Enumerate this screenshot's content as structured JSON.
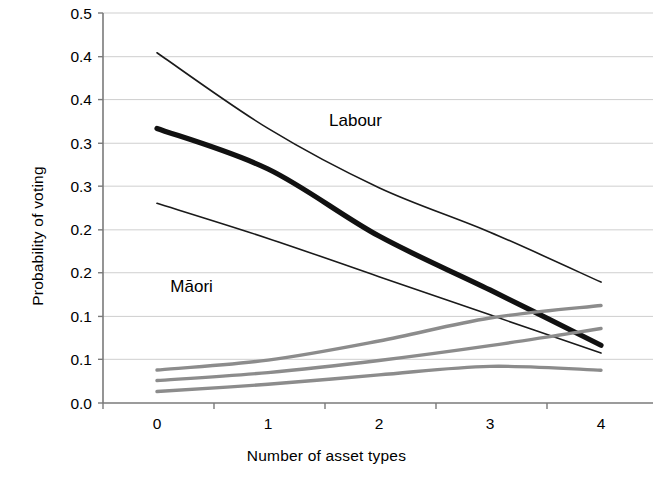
{
  "chart_data": {
    "type": "line",
    "title": "",
    "xlabel": "Number of asset types",
    "ylabel": "Probability of voting",
    "x": [
      0,
      1,
      2,
      3,
      4
    ],
    "xtick_labels": [
      "0",
      "1",
      "2",
      "3",
      "4"
    ],
    "ytick_labels": [
      "0.5",
      "0.4",
      "0.4",
      "0.3",
      "0.3",
      "0.2",
      "0.2",
      "0.1",
      "0.1",
      "0.0"
    ],
    "ytick_values": [
      0.5,
      0.444,
      0.389,
      0.333,
      0.278,
      0.222,
      0.167,
      0.111,
      0.056,
      0.0
    ],
    "ylim": [
      0.0,
      0.5
    ],
    "xlim": [
      -0.5,
      4.5
    ],
    "grid": true,
    "grid_axis": "y",
    "legend": "none",
    "annotations": [
      {
        "text": "Labour",
        "x": 1.55,
        "y": 0.355
      },
      {
        "text": "Māori",
        "x": 0.12,
        "y": 0.142
      }
    ],
    "colors": {
      "labour_main": "#111111",
      "labour_bounds": "#1a1a1a",
      "maori": "#8c8c8c",
      "gridline": "#c9c9c9",
      "axis": "#7a7a7a"
    },
    "series": [
      {
        "name": "Labour upper bound",
        "group": "Labour",
        "role": "confidence-upper",
        "color": "#1a1a1a",
        "width": 1.6,
        "values": [
          0.449,
          0.352,
          0.276,
          0.219,
          0.155
        ]
      },
      {
        "name": "Labour",
        "group": "Labour",
        "role": "fitted",
        "color": "#111111",
        "width": 5.2,
        "values": [
          0.352,
          0.3,
          0.214,
          0.145,
          0.074
        ]
      },
      {
        "name": "Labour lower bound",
        "group": "Labour",
        "role": "confidence-lower",
        "color": "#1a1a1a",
        "width": 1.6,
        "values": [
          0.256,
          0.211,
          0.162,
          0.113,
          0.064
        ]
      },
      {
        "name": "Māori upper bound",
        "group": "Māori",
        "role": "confidence-upper",
        "color": "#8c8c8c",
        "width": 3.4,
        "values": [
          0.0423,
          0.055,
          0.0795,
          0.109,
          0.125
        ]
      },
      {
        "name": "Māori",
        "group": "Māori",
        "role": "fitted",
        "color": "#8c8c8c",
        "width": 3.4,
        "values": [
          0.0288,
          0.039,
          0.0545,
          0.0735,
          0.0955
        ]
      },
      {
        "name": "Māori lower bound",
        "group": "Māori",
        "role": "confidence-lower",
        "color": "#8c8c8c",
        "width": 3.4,
        "values": [
          0.0147,
          0.024,
          0.036,
          0.047,
          0.042
        ]
      }
    ]
  }
}
